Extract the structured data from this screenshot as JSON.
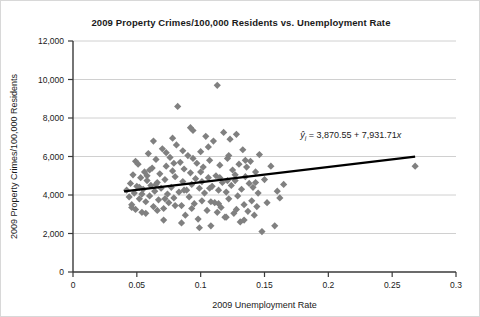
{
  "chart_data": {
    "type": "scatter",
    "title": "2009 Property Crimes/100,000 Residents vs. Unemployment Rate",
    "xlabel": "2009 Unemployment Rate",
    "ylabel": "2009 Property Crimes/100,000 Residents",
    "xlim": [
      0,
      0.3
    ],
    "ylim": [
      0,
      12000
    ],
    "xticks": [
      "0",
      "0.05",
      "0.1",
      "0.15",
      "0.2",
      "0.25",
      "0.3"
    ],
    "xtick_values": [
      0,
      0.05,
      0.1,
      0.15,
      0.2,
      0.25,
      0.3
    ],
    "yticks": [
      "0",
      "2,000",
      "4,000",
      "6,000",
      "8,000",
      "10,000",
      "12,000"
    ],
    "ytick_values": [
      0,
      2000,
      4000,
      6000,
      8000,
      10000,
      12000
    ],
    "grid": "horizontal",
    "legend": "none",
    "marker": "diamond",
    "marker_color": "#808080",
    "series_name": "Counties",
    "annotation": {
      "text": "ŷi = 3,870.55 + 7,931.71x",
      "lhs": "ŷ",
      "subscript": "i",
      "equals": " = ",
      "intercept": "3,870.55",
      "plus": " + ",
      "slope": "7,931.71",
      "variable": "x",
      "x": 0.178,
      "y": 6950
    },
    "trendline": {
      "type": "linear",
      "intercept": 3870.55,
      "slope": 7931.71,
      "color": "#000000",
      "x_start": 0.04,
      "x_end": 0.268
    },
    "points": [
      [
        0.042,
        4250
      ],
      [
        0.044,
        3900
      ],
      [
        0.045,
        4600
      ],
      [
        0.046,
        3500
      ],
      [
        0.047,
        5050
      ],
      [
        0.048,
        4100
      ],
      [
        0.049,
        3250
      ],
      [
        0.05,
        4450
      ],
      [
        0.051,
        5600
      ],
      [
        0.052,
        3800
      ],
      [
        0.053,
        4900
      ],
      [
        0.054,
        3100
      ],
      [
        0.055,
        4300
      ],
      [
        0.056,
        5200
      ],
      [
        0.057,
        3650
      ],
      [
        0.058,
        4750
      ],
      [
        0.059,
        6150
      ],
      [
        0.06,
        3950
      ],
      [
        0.061,
        4500
      ],
      [
        0.062,
        5400
      ],
      [
        0.063,
        3400
      ],
      [
        0.064,
        4200
      ],
      [
        0.065,
        5850
      ],
      [
        0.066,
        4650
      ],
      [
        0.067,
        3750
      ],
      [
        0.068,
        5100
      ],
      [
        0.069,
        4350
      ],
      [
        0.07,
        6400
      ],
      [
        0.071,
        3300
      ],
      [
        0.072,
        4800
      ],
      [
        0.073,
        5500
      ],
      [
        0.074,
        4050
      ],
      [
        0.075,
        3600
      ],
      [
        0.076,
        5950
      ],
      [
        0.077,
        4400
      ],
      [
        0.078,
        5250
      ],
      [
        0.079,
        3850
      ],
      [
        0.08,
        4950
      ],
      [
        0.081,
        6600
      ],
      [
        0.082,
        8600
      ],
      [
        0.083,
        4150
      ],
      [
        0.084,
        5700
      ],
      [
        0.085,
        3450
      ],
      [
        0.086,
        4700
      ],
      [
        0.087,
        5350
      ],
      [
        0.088,
        2950
      ],
      [
        0.089,
        4250
      ],
      [
        0.09,
        6050
      ],
      [
        0.091,
        3900
      ],
      [
        0.092,
        5150
      ],
      [
        0.093,
        4550
      ],
      [
        0.094,
        7350
      ],
      [
        0.095,
        3550
      ],
      [
        0.096,
        4850
      ],
      [
        0.097,
        5650
      ],
      [
        0.098,
        2750
      ],
      [
        0.099,
        4350
      ],
      [
        0.1,
        6250
      ],
      [
        0.101,
        3700
      ],
      [
        0.102,
        5450
      ],
      [
        0.103,
        4100
      ],
      [
        0.104,
        7050
      ],
      [
        0.105,
        3200
      ],
      [
        0.106,
        4900
      ],
      [
        0.107,
        5800
      ],
      [
        0.108,
        2400
      ],
      [
        0.109,
        4450
      ],
      [
        0.11,
        6800
      ],
      [
        0.111,
        3600
      ],
      [
        0.112,
        5000
      ],
      [
        0.113,
        9700
      ],
      [
        0.114,
        4250
      ],
      [
        0.115,
        5550
      ],
      [
        0.116,
        3350
      ],
      [
        0.117,
        4650
      ],
      [
        0.118,
        7250
      ],
      [
        0.119,
        2850
      ],
      [
        0.12,
        4150
      ],
      [
        0.121,
        5900
      ],
      [
        0.122,
        3800
      ],
      [
        0.123,
        6900
      ],
      [
        0.124,
        4500
      ],
      [
        0.125,
        5300
      ],
      [
        0.126,
        3050
      ],
      [
        0.127,
        4750
      ],
      [
        0.128,
        7150
      ],
      [
        0.129,
        3950
      ],
      [
        0.13,
        5600
      ],
      [
        0.131,
        2600
      ],
      [
        0.132,
        4300
      ],
      [
        0.133,
        6350
      ],
      [
        0.134,
        3500
      ],
      [
        0.135,
        4950
      ],
      [
        0.136,
        5450
      ],
      [
        0.137,
        3150
      ],
      [
        0.138,
        4600
      ],
      [
        0.139,
        5750
      ],
      [
        0.14,
        3700
      ],
      [
        0.141,
        4400
      ],
      [
        0.142,
        2950
      ],
      [
        0.143,
        5200
      ],
      [
        0.144,
        3400
      ],
      [
        0.145,
        4100
      ],
      [
        0.146,
        6100
      ],
      [
        0.148,
        2100
      ],
      [
        0.15,
        4800
      ],
      [
        0.152,
        3600
      ],
      [
        0.155,
        5500
      ],
      [
        0.158,
        2400
      ],
      [
        0.16,
        4200
      ],
      [
        0.162,
        3850
      ],
      [
        0.165,
        4550
      ],
      [
        0.057,
        3050
      ],
      [
        0.063,
        6800
      ],
      [
        0.071,
        2700
      ],
      [
        0.078,
        6950
      ],
      [
        0.085,
        2550
      ],
      [
        0.092,
        7500
      ],
      [
        0.099,
        2300
      ],
      [
        0.106,
        6500
      ],
      [
        0.113,
        3100
      ],
      [
        0.12,
        2850
      ],
      [
        0.127,
        5050
      ],
      [
        0.134,
        2700
      ],
      [
        0.049,
        5750
      ],
      [
        0.054,
        4050
      ],
      [
        0.06,
        5300
      ],
      [
        0.066,
        3200
      ],
      [
        0.073,
        6200
      ],
      [
        0.08,
        3450
      ],
      [
        0.087,
        4250
      ],
      [
        0.094,
        5900
      ],
      [
        0.101,
        4700
      ],
      [
        0.108,
        3650
      ],
      [
        0.115,
        4900
      ],
      [
        0.122,
        6050
      ],
      [
        0.046,
        3350
      ],
      [
        0.052,
        4400
      ],
      [
        0.058,
        5000
      ],
      [
        0.065,
        4550
      ],
      [
        0.072,
        3800
      ],
      [
        0.079,
        5650
      ],
      [
        0.086,
        6300
      ],
      [
        0.093,
        3300
      ],
      [
        0.1,
        5200
      ],
      [
        0.107,
        4350
      ],
      [
        0.114,
        3550
      ],
      [
        0.121,
        4750
      ],
      [
        0.128,
        3250
      ],
      [
        0.135,
        5800
      ],
      [
        0.143,
        4650
      ],
      [
        0.268,
        5500
      ]
    ]
  }
}
